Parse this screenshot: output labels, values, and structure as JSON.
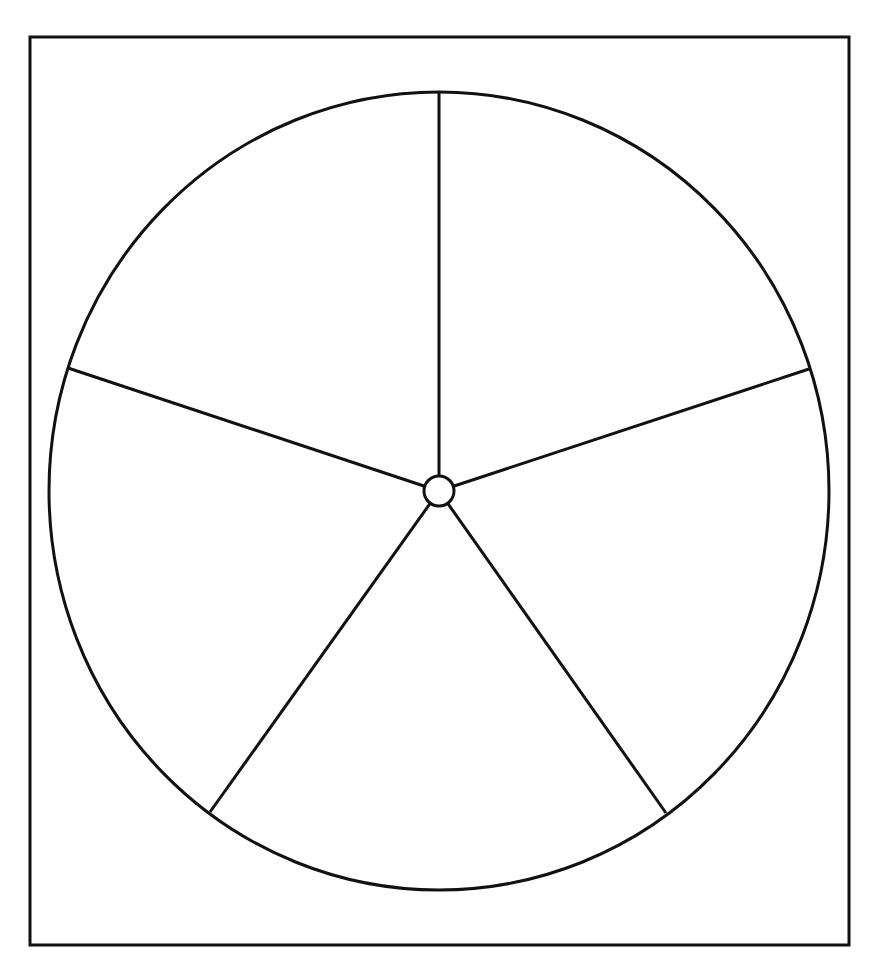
{
  "diagram": {
    "type": "blank-pie-template",
    "section_count": 5,
    "section_labels": [
      "",
      "",
      "",
      "",
      ""
    ],
    "colors": {
      "background": "#ffffff",
      "stroke": "#111111"
    },
    "frame": {
      "x": 30,
      "y": 37,
      "width": 819,
      "height": 908,
      "stroke_width": 3
    },
    "circle": {
      "cx": 439,
      "cy": 491,
      "rx": 390,
      "ry": 399,
      "stroke_width": 3
    },
    "hub": {
      "cx": 439,
      "cy": 491,
      "r": 15,
      "stroke_width": 3
    },
    "spokes": [
      {
        "name": "spoke-top",
        "x2": 439,
        "y2": 93
      },
      {
        "name": "spoke-right",
        "x2": 809,
        "y2": 369
      },
      {
        "name": "spoke-bottom-right",
        "x2": 666,
        "y2": 813
      },
      {
        "name": "spoke-bottom-left",
        "x2": 210,
        "y2": 812
      },
      {
        "name": "spoke-left",
        "x2": 68,
        "y2": 368
      }
    ]
  }
}
